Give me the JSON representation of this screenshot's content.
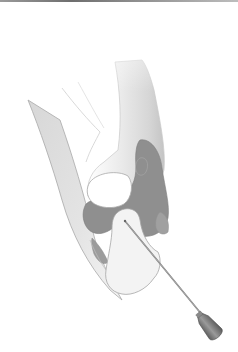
{
  "figure": {
    "colors": {
      "background": "#ffffff",
      "top_rule": "#7a7a7a",
      "bone_light": "#f2f2f2",
      "bone_mid": "#d9d9d9",
      "bone_shadow": "#bdbdbd",
      "cavity": "#8f8f8f",
      "cavity_dark": "#7c7c7c",
      "outline": "#9e9e9e",
      "needle_shaft": "#8a8a8a",
      "needle_hub": "#6f6f6f"
    }
  }
}
